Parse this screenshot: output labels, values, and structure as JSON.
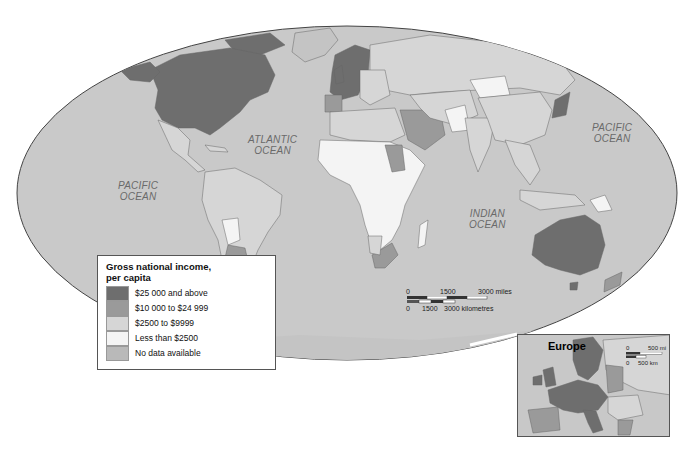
{
  "map": {
    "title": "Gross national income per capita world map",
    "colors": {
      "ocean": "#c9c9c9",
      "tier_25000_plus": "#6e6e6e",
      "tier_10000_24999": "#9a9a9a",
      "tier_2500_9999": "#d6d6d6",
      "tier_less_2500": "#f4f4f4",
      "no_data": "#b9b9b9",
      "border": "#555555"
    },
    "ocean_labels": {
      "pacific_west": [
        "PACIFIC",
        "OCEAN"
      ],
      "atlantic": [
        "ATLANTIC",
        "OCEAN"
      ],
      "indian": [
        "INDIAN",
        "OCEAN"
      ],
      "pacific_east": [
        "PACIFIC",
        "OCEAN"
      ]
    }
  },
  "legend": {
    "title_line1": "Gross national income,",
    "title_line2": "per capita",
    "items": [
      {
        "label": "$25 000 and above",
        "color": "#6e6e6e"
      },
      {
        "label": "$10 000 to $24 999",
        "color": "#9a9a9a"
      },
      {
        "label": "$2500 to $9999",
        "color": "#d6d6d6"
      },
      {
        "label": "Less than $2500",
        "color": "#f4f4f4"
      },
      {
        "label": "No data available",
        "color": "#b9b9b9"
      }
    ]
  },
  "scale": {
    "miles_zero": "0",
    "miles_mid": "1500",
    "miles_end": "3000 miles",
    "km_zero": "0",
    "km_mid": "1500",
    "km_end": "3000 kilometres"
  },
  "inset": {
    "title": "Europe",
    "mi_zero": "0",
    "mi_end": "500 mi",
    "km_zero": "0",
    "km_end": "500 km"
  }
}
